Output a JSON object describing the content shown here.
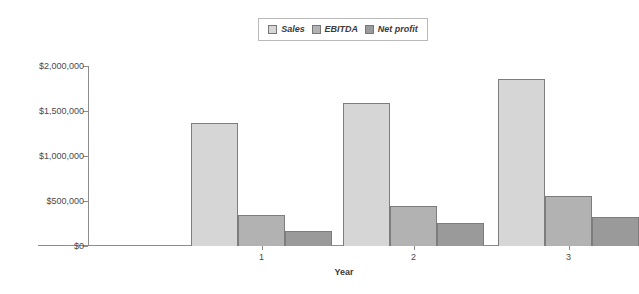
{
  "chart_data": {
    "type": "bar",
    "title": "",
    "xlabel": "Year",
    "ylabel": "",
    "categories": [
      "1",
      "2",
      "3"
    ],
    "series": [
      {
        "name": "Sales",
        "color": "#d6d6d6",
        "values": [
          1370000,
          1590000,
          1855000
        ]
      },
      {
        "name": "EBITDA",
        "color": "#b2b2b2",
        "values": [
          345000,
          445000,
          555000
        ]
      },
      {
        "name": "Net profit",
        "color": "#9a9a9a",
        "values": [
          170000,
          255000,
          320000
        ]
      }
    ],
    "ylim": [
      0,
      2000000
    ],
    "y_ticks": [
      0,
      500000,
      1000000,
      1500000,
      2000000
    ],
    "y_tick_labels": [
      "$0",
      "$500,000",
      "$1,000,000",
      "$1,500,000",
      "$2,000,000"
    ],
    "grid": false,
    "legend_position": "top-center",
    "legend_items": [
      "Sales",
      "EBITDA",
      "Net profit"
    ]
  }
}
